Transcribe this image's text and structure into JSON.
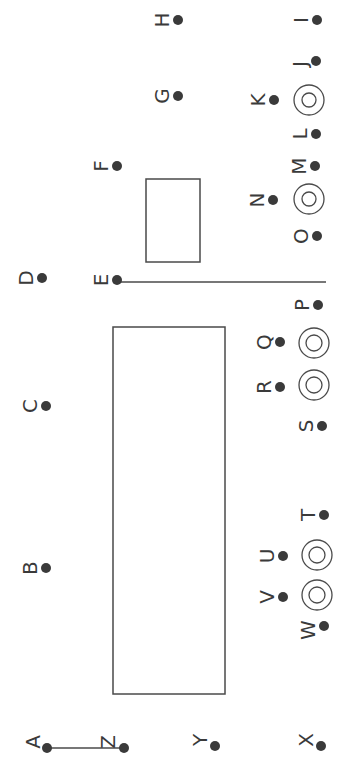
{
  "diagram": {
    "title": "",
    "colors": {
      "stroke": "#4a4a4a",
      "dot": "#3a3a3a",
      "label": "#3a3a3a",
      "background": "#ffffff"
    },
    "points": [
      {
        "label": "A",
        "x": 47,
        "y": 748,
        "lx": 33,
        "ly": 742
      },
      {
        "label": "B",
        "x": 46,
        "y": 568,
        "lx": 30,
        "ly": 568
      },
      {
        "label": "C",
        "x": 46,
        "y": 406,
        "lx": 30,
        "ly": 406
      },
      {
        "label": "D",
        "x": 42,
        "y": 278,
        "lx": 26,
        "ly": 278
      },
      {
        "label": "E",
        "x": 117,
        "y": 280,
        "lx": 101,
        "ly": 280
      },
      {
        "label": "F",
        "x": 117,
        "y": 166,
        "lx": 101,
        "ly": 166
      },
      {
        "label": "G",
        "x": 178,
        "y": 96,
        "lx": 162,
        "ly": 96
      },
      {
        "label": "H",
        "x": 178,
        "y": 20,
        "lx": 162,
        "ly": 20
      },
      {
        "label": "I",
        "x": 317,
        "y": 20,
        "lx": 301,
        "ly": 20
      },
      {
        "label": "J",
        "x": 316,
        "y": 61,
        "lx": 300,
        "ly": 64
      },
      {
        "label": "K",
        "x": 274,
        "y": 100,
        "lx": 258,
        "ly": 100
      },
      {
        "label": "L",
        "x": 316,
        "y": 134,
        "lx": 300,
        "ly": 134
      },
      {
        "label": "M",
        "x": 315,
        "y": 166,
        "lx": 299,
        "ly": 166
      },
      {
        "label": "N",
        "x": 273,
        "y": 200,
        "lx": 257,
        "ly": 200
      },
      {
        "label": "O",
        "x": 317,
        "y": 236,
        "lx": 301,
        "ly": 236
      },
      {
        "label": "P",
        "x": 318,
        "y": 305,
        "lx": 302,
        "ly": 305
      },
      {
        "label": "Q",
        "x": 280,
        "y": 342,
        "lx": 264,
        "ly": 342
      },
      {
        "label": "R",
        "x": 280,
        "y": 387,
        "lx": 264,
        "ly": 387
      },
      {
        "label": "S",
        "x": 322,
        "y": 426,
        "lx": 306,
        "ly": 426
      },
      {
        "label": "T",
        "x": 324,
        "y": 515,
        "lx": 308,
        "ly": 515
      },
      {
        "label": "U",
        "x": 283,
        "y": 556,
        "lx": 267,
        "ly": 556
      },
      {
        "label": "V",
        "x": 283,
        "y": 597,
        "lx": 267,
        "ly": 597
      },
      {
        "label": "W",
        "x": 324,
        "y": 626,
        "lx": 308,
        "ly": 630
      },
      {
        "label": "X",
        "x": 321,
        "y": 746,
        "lx": 306,
        "ly": 740
      },
      {
        "label": "Y",
        "x": 215,
        "y": 746,
        "lx": 200,
        "ly": 740
      },
      {
        "label": "Z",
        "x": 124,
        "y": 748,
        "lx": 108,
        "ly": 742
      }
    ],
    "rectangles": [
      {
        "name": "large-rectangle",
        "x": 113,
        "y": 327,
        "w": 112,
        "h": 367
      },
      {
        "name": "small-rectangle",
        "x": 146,
        "y": 179,
        "w": 54,
        "h": 83
      }
    ],
    "lines": [
      {
        "name": "line-E",
        "x1": 118,
        "y1": 282,
        "x2": 326,
        "y2": 282
      },
      {
        "name": "line-A-Z",
        "x1": 47,
        "y1": 748,
        "x2": 124,
        "y2": 748
      }
    ],
    "concentric_circles": [
      {
        "name": "target-near-K",
        "cx": 309,
        "cy": 100,
        "r_outer": 15,
        "r_inner": 7
      },
      {
        "name": "target-near-N",
        "cx": 309,
        "cy": 199,
        "r_outer": 15,
        "r_inner": 7
      },
      {
        "name": "target-near-Q",
        "cx": 314,
        "cy": 343,
        "r_outer": 15,
        "r_inner": 8
      },
      {
        "name": "target-near-R",
        "cx": 314,
        "cy": 385,
        "r_outer": 15,
        "r_inner": 8
      },
      {
        "name": "target-near-U",
        "cx": 317,
        "cy": 555,
        "r_outer": 15,
        "r_inner": 8
      },
      {
        "name": "target-near-V",
        "cx": 317,
        "cy": 595,
        "r_outer": 15,
        "r_inner": 8
      }
    ]
  }
}
